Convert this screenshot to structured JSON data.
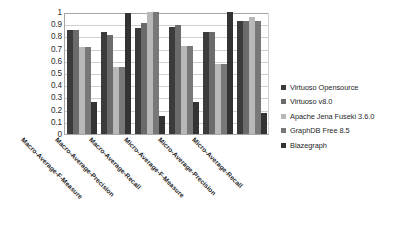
{
  "chart_data": {
    "type": "bar",
    "title": "",
    "subtitle": "",
    "xlabel": "",
    "ylabel": "",
    "ylim": [
      0,
      1
    ],
    "ytick_labels": [
      "1",
      "0.9",
      "0.8",
      "0.7",
      "0.6",
      "0.5",
      "0.4",
      "0.3",
      "0.2",
      "0.1",
      "0"
    ],
    "ytick_values": [
      1,
      0.9,
      0.8,
      0.7,
      0.6,
      0.5,
      0.4,
      0.3,
      0.2,
      0.1,
      0
    ],
    "grid": true,
    "grid_axis": "y",
    "legend_position": "right",
    "categories": [
      "Macro-Average-F-Measure",
      "Macro-Average-Precision",
      "Macro-Average-Recall",
      "Micro-Average-F-Measure",
      "Micro-Average-Precision",
      "Micro-Average-Recall"
    ],
    "series": [
      {
        "name": "Virtuoso Opensource",
        "color": "#3b3b3b",
        "values": [
          0.85,
          0.84,
          0.87,
          0.88,
          0.84,
          0.93
        ]
      },
      {
        "name": "Virtuoso v8.0",
        "color": "#6b6b6b",
        "values": [
          0.85,
          0.81,
          0.91,
          0.89,
          0.84,
          0.93
        ]
      },
      {
        "name": "Apache Jena Fuseki 3.6.0",
        "color": "#b8b8b8",
        "values": [
          0.71,
          0.55,
          1.0,
          0.72,
          0.57,
          0.96
        ]
      },
      {
        "name": "GraphDB Free 8.5",
        "color": "#787878",
        "values": [
          0.71,
          0.55,
          1.0,
          0.72,
          0.57,
          0.93
        ]
      },
      {
        "name": "Blazegraph",
        "color": "#333333",
        "values": [
          0.26,
          0.99,
          0.15,
          0.26,
          1.0,
          0.17
        ]
      }
    ]
  },
  "legend": {
    "items": [
      {
        "label": "Virtuoso Opensource",
        "color": "#3b3b3b"
      },
      {
        "label": "Virtuoso v8.0",
        "color": "#6b6b6b"
      },
      {
        "label": "Apache Jena Fuseki 3.6.0",
        "color": "#b8b8b8"
      },
      {
        "label": "GraphDB Free 8.5",
        "color": "#787878"
      },
      {
        "label": "Blazegraph",
        "color": "#333333"
      }
    ]
  }
}
